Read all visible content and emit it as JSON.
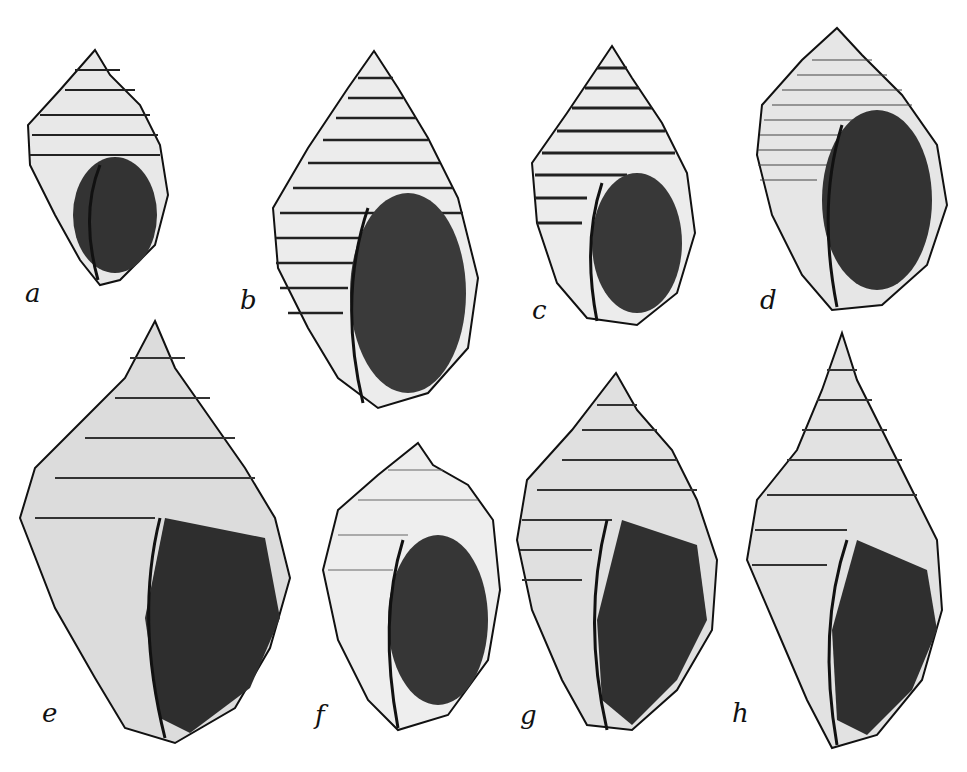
{
  "plate": {
    "description": "Engraved plate of eight gastropod shells, aperture view",
    "figures": [
      {
        "label": "a"
      },
      {
        "label": "b"
      },
      {
        "label": "c"
      },
      {
        "label": "d"
      },
      {
        "label": "e"
      },
      {
        "label": "f"
      },
      {
        "label": "g"
      },
      {
        "label": "h"
      }
    ]
  }
}
